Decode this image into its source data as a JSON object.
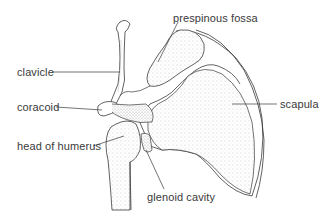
{
  "diagram": {
    "colors": {
      "ink": "#3a3a3a",
      "stipple": "#9a9a9a",
      "background": "#ffffff"
    },
    "labels": [
      {
        "id": "prespinous-fossa",
        "text": "prespinous fossa",
        "x": 173,
        "y": 12,
        "points_to": [
          156,
          58
        ]
      },
      {
        "id": "clavicle",
        "text": "clavicle",
        "x": 17,
        "y": 66,
        "points_to": [
          120,
          72
        ]
      },
      {
        "id": "coracoid",
        "text": "coracoid",
        "x": 17,
        "y": 101,
        "points_to": [
          104,
          110
        ]
      },
      {
        "id": "scapula",
        "text": "scapula",
        "x": 280,
        "y": 99,
        "points_to": [
          232,
          104
        ]
      },
      {
        "id": "head-of-humerus",
        "text": "head of humerus",
        "x": 17,
        "y": 140,
        "points_to": [
          124,
          136
        ]
      },
      {
        "id": "glenoid-cavity",
        "text": "glenoid cavity",
        "x": 147,
        "y": 192,
        "points_to": [
          146,
          149
        ]
      }
    ]
  }
}
